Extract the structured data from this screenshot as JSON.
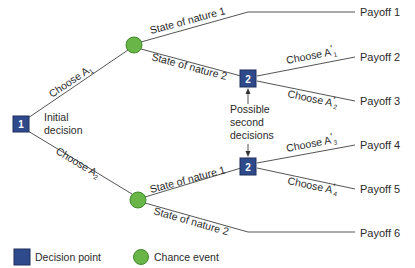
{
  "colors": {
    "decision": "#2f4a8a",
    "decision_border": "#1f2f5e",
    "chance": "#6ab547",
    "chance_border": "#3f8a2a",
    "line": "#555555",
    "text": "#2b2b2b"
  },
  "nodes": {
    "initial": {
      "label": "1",
      "caption_line1": "Initial",
      "caption_line2": "decision"
    },
    "second_top": {
      "label": "2"
    },
    "second_bottom": {
      "label": "2"
    }
  },
  "branches": {
    "choose_a1": {
      "text": "Choose A",
      "sub": "1"
    },
    "choose_a2": {
      "text": "Choose A",
      "sub": "2"
    },
    "state1_top": "State of nature 1",
    "state2_top": "State of nature 2",
    "state1_bottom": "State of nature 1",
    "state2_bottom": "State of nature 2",
    "choose_a1p": {
      "text": "Choose A",
      "prime": "'",
      "sub": "1"
    },
    "choose_a2p": {
      "text": "Choose A",
      "prime": "'",
      "sub": "2"
    },
    "choose_a3p": {
      "text": "Choose A",
      "prime": "'",
      "sub": "3"
    },
    "choose_a4p": {
      "text": "Choose A",
      "prime": "'",
      "sub": "4"
    }
  },
  "annotation": {
    "line1": "Possible",
    "line2": "second",
    "line3": "decisions"
  },
  "payoffs": [
    "Payoff 1",
    "Payoff 2",
    "Payoff 3",
    "Payoff 4",
    "Payoff 5",
    "Payoff 6"
  ],
  "legend": {
    "decision": "Decision point",
    "chance": "Chance event"
  }
}
